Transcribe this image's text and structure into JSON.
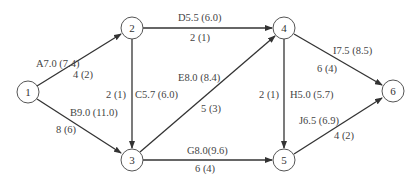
{
  "diagram": {
    "type": "activity-on-arrow network",
    "nodes": [
      {
        "id": "1",
        "label": "1",
        "x": 28,
        "y": 92
      },
      {
        "id": "2",
        "label": "2",
        "x": 132,
        "y": 28
      },
      {
        "id": "3",
        "label": "3",
        "x": 132,
        "y": 160
      },
      {
        "id": "4",
        "label": "4",
        "x": 284,
        "y": 28
      },
      {
        "id": "5",
        "label": "5",
        "x": 284,
        "y": 160
      },
      {
        "id": "6",
        "label": "6",
        "x": 393,
        "y": 91
      }
    ],
    "edges": [
      {
        "id": "A",
        "from": "1",
        "to": "2",
        "activity": "A7.0 (7.4)",
        "time": "4 (2)"
      },
      {
        "id": "B",
        "from": "1",
        "to": "3",
        "activity": "B9.0 (11.0)",
        "time": "8 (6)"
      },
      {
        "id": "C",
        "from": "2",
        "to": "3",
        "activity": "C5.7 (6.0)",
        "time": "2 (1)"
      },
      {
        "id": "D",
        "from": "2",
        "to": "4",
        "activity": "D5.5 (6.0)",
        "time": "2 (1)"
      },
      {
        "id": "E",
        "from": "3",
        "to": "4",
        "activity": "E8.0 (8.4)",
        "time": "5 (3)"
      },
      {
        "id": "G",
        "from": "3",
        "to": "5",
        "activity": "G8.0(9.6)",
        "time": "6 (4)"
      },
      {
        "id": "H",
        "from": "4",
        "to": "5",
        "activity": "H5.0 (5.7)",
        "time": "2 (1)"
      },
      {
        "id": "I",
        "from": "4",
        "to": "6",
        "activity": "I7.5 (8.5)",
        "time": "6 (4)"
      },
      {
        "id": "J",
        "from": "5",
        "to": "6",
        "activity": "J6.5 (6.9)",
        "time": "4 (2)"
      }
    ]
  },
  "colors": {
    "line": "#333333",
    "text": "#444444",
    "node_stroke": "#555555",
    "background": "#ffffff"
  }
}
